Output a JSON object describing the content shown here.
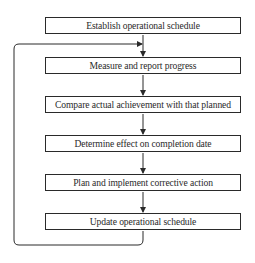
{
  "diagram": {
    "type": "flowchart",
    "steps": [
      {
        "id": "s1",
        "label": "Establish operational schedule"
      },
      {
        "id": "s2",
        "label": "Measure and report progress"
      },
      {
        "id": "s3",
        "label": "Compare actual achievement with that planned"
      },
      {
        "id": "s4",
        "label": "Determine effect on completion date"
      },
      {
        "id": "s5",
        "label": "Plan and implement corrective action"
      },
      {
        "id": "s6",
        "label": "Update operational schedule"
      }
    ],
    "edges": [
      {
        "from": "s1",
        "to": "s2"
      },
      {
        "from": "s2",
        "to": "s3"
      },
      {
        "from": "s3",
        "to": "s4"
      },
      {
        "from": "s4",
        "to": "s5"
      },
      {
        "from": "s5",
        "to": "s6"
      },
      {
        "from": "s6",
        "to": "s2",
        "type": "feedback-loop"
      }
    ],
    "colors": {
      "line": "#2a2a2a",
      "background": "#ffffff"
    }
  }
}
